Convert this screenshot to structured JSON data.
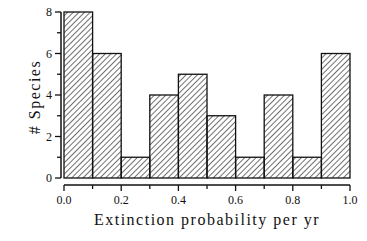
{
  "chart_data": {
    "type": "bar",
    "subtype": "histogram",
    "title": "",
    "xlabel": "Extinction probability per yr",
    "ylabel": "# Species",
    "bin_edges": [
      0.0,
      0.1,
      0.2,
      0.3,
      0.4,
      0.5,
      0.6,
      0.7,
      0.8,
      0.9,
      1.0
    ],
    "categories": [
      "0.0-0.1",
      "0.1-0.2",
      "0.2-0.3",
      "0.3-0.4",
      "0.4-0.5",
      "0.5-0.6",
      "0.6-0.7",
      "0.7-0.8",
      "0.8-0.9",
      "0.9-1.0"
    ],
    "values": [
      8,
      6,
      1,
      4,
      5,
      3,
      1,
      4,
      1,
      6
    ],
    "xlim": [
      0.0,
      1.0
    ],
    "ylim": [
      0,
      8
    ],
    "x_tick_labels": [
      "0.0",
      "0.2",
      "0.4",
      "0.6",
      "0.8",
      "1.0"
    ],
    "y_tick_labels": [
      "0",
      "2",
      "4",
      "6",
      "8"
    ],
    "grid": false,
    "legend": null,
    "bar_fill": "diagonal-hatch",
    "colors": {
      "bar_edge": "#111111",
      "hatch": "#222222",
      "background": "#ffffff"
    }
  }
}
